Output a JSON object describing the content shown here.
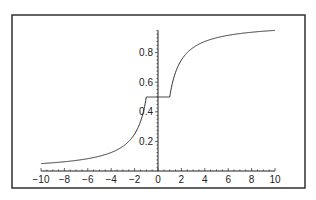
{
  "chart_data": {
    "type": "line",
    "title": "",
    "xlabel": "",
    "ylabel": "",
    "xlim": [
      -10,
      10
    ],
    "ylim": [
      0,
      0.95
    ],
    "grid": false,
    "legend": null,
    "x_ticks": [
      -10,
      -8,
      -6,
      -4,
      -2,
      0,
      2,
      4,
      6,
      8,
      10
    ],
    "x_tick_labels": [
      "−10",
      "−8",
      "−6",
      "−4",
      "−2",
      "0",
      "2",
      "4",
      "6",
      "8",
      "10"
    ],
    "y_ticks": [
      0.2,
      0.4,
      0.6,
      0.8
    ],
    "y_tick_labels": [
      "0.2",
      "0.4",
      "0.6",
      "0.8"
    ],
    "series": [
      {
        "name": "f(x)",
        "description": "0.5/|x| for x<-1, 0.5 for -1<=x<=1, 1-0.5/x for x>1",
        "x": [
          -10,
          -8,
          -6,
          -4,
          -3,
          -2,
          -1.5,
          -1,
          0,
          1,
          1.5,
          2,
          3,
          4,
          6,
          8,
          10
        ],
        "y": [
          0.05,
          0.0625,
          0.083,
          0.125,
          0.167,
          0.25,
          0.333,
          0.5,
          0.5,
          0.5,
          0.667,
          0.75,
          0.833,
          0.875,
          0.917,
          0.9375,
          0.95
        ]
      }
    ],
    "colors": {
      "line": "#333333",
      "axis": "#222222",
      "frame": "#222222"
    }
  }
}
